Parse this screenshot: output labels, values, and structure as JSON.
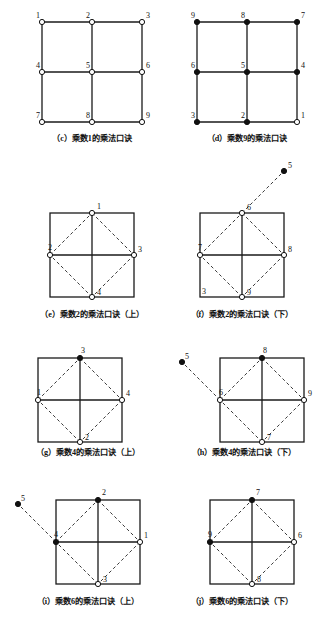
{
  "figure": {
    "panels": [
      {
        "key": "c",
        "type": "grid3x3",
        "caption": "（c）乘数1的乘法口诀",
        "nodes": [
          {
            "label": "1",
            "col": 0,
            "row": 0,
            "filled": false,
            "lx": -6,
            "ly": -4
          },
          {
            "label": "2",
            "col": 1,
            "row": 0,
            "filled": false,
            "lx": -6,
            "ly": -4
          },
          {
            "label": "3",
            "col": 2,
            "row": 0,
            "filled": false,
            "lx": 4,
            "ly": -4
          },
          {
            "label": "4",
            "col": 0,
            "row": 1,
            "filled": false,
            "lx": -6,
            "ly": -4
          },
          {
            "label": "5",
            "col": 1,
            "row": 1,
            "filled": false,
            "lx": -6,
            "ly": -4
          },
          {
            "label": "6",
            "col": 2,
            "row": 1,
            "filled": false,
            "lx": 4,
            "ly": -4
          },
          {
            "label": "7",
            "col": 0,
            "row": 2,
            "filled": false,
            "lx": -6,
            "ly": -4
          },
          {
            "label": "8",
            "col": 1,
            "row": 2,
            "filled": false,
            "lx": -6,
            "ly": -4
          },
          {
            "label": "9",
            "col": 2,
            "row": 2,
            "filled": false,
            "lx": 4,
            "ly": -4
          }
        ],
        "external": null
      },
      {
        "key": "d",
        "type": "grid3x3",
        "caption": "（d）乘数9的乘法口诀",
        "nodes": [
          {
            "label": "9",
            "col": 0,
            "row": 0,
            "filled": true,
            "lx": -6,
            "ly": -4
          },
          {
            "label": "8",
            "col": 1,
            "row": 0,
            "filled": true,
            "lx": -6,
            "ly": -4
          },
          {
            "label": "7",
            "col": 2,
            "row": 0,
            "filled": true,
            "lx": 4,
            "ly": -4
          },
          {
            "label": "6",
            "col": 0,
            "row": 1,
            "filled": true,
            "lx": -6,
            "ly": -4
          },
          {
            "label": "5",
            "col": 1,
            "row": 1,
            "filled": true,
            "lx": -6,
            "ly": -4
          },
          {
            "label": "4",
            "col": 2,
            "row": 1,
            "filled": true,
            "lx": 4,
            "ly": -4
          },
          {
            "label": "3",
            "col": 0,
            "row": 2,
            "filled": true,
            "lx": -6,
            "ly": -4
          },
          {
            "label": "2",
            "col": 1,
            "row": 2,
            "filled": true,
            "lx": -6,
            "ly": -4
          },
          {
            "label": "1",
            "col": 2,
            "row": 2,
            "filled": false,
            "lx": 4,
            "ly": -4
          }
        ],
        "external": null
      },
      {
        "key": "e",
        "type": "diamond",
        "caption": "（e）乘数2的乘法口诀（上）",
        "nodes": [
          {
            "label": "1",
            "pos": "top",
            "filled": false,
            "lx": 5,
            "ly": -4
          },
          {
            "label": "2",
            "pos": "left",
            "filled": false,
            "lx": -2,
            "ly": -5
          },
          {
            "label": "3",
            "pos": "right",
            "filled": false,
            "lx": 4,
            "ly": -3
          },
          {
            "label": "4",
            "pos": "bottom",
            "filled": false,
            "lx": 5,
            "ly": -2
          }
        ],
        "corner_label": null,
        "external": null
      },
      {
        "key": "f",
        "type": "diamond",
        "caption": "（f）乘数2的乘法口诀（下）",
        "nodes": [
          {
            "label": "6",
            "pos": "top",
            "filled": false,
            "lx": 5,
            "ly": -3
          },
          {
            "label": "7",
            "pos": "left",
            "filled": false,
            "lx": -2,
            "ly": -5
          },
          {
            "label": "8",
            "pos": "right",
            "filled": false,
            "lx": 4,
            "ly": -3
          },
          {
            "label": "9",
            "pos": "bottom",
            "filled": false,
            "lx": 5,
            "ly": -2
          }
        ],
        "corner_label": {
          "text": "3",
          "corner": "bottom-left"
        },
        "external": {
          "label": "5",
          "filled": true,
          "attach": "top",
          "dx": 42,
          "dy": -42,
          "lx": 4,
          "ly": -3
        }
      },
      {
        "key": "g",
        "type": "diamond",
        "caption": "（g）乘数4的乘法口诀（上）",
        "nodes": [
          {
            "label": "3",
            "pos": "top",
            "filled": true,
            "lx": 1,
            "ly": -5
          },
          {
            "label": "1",
            "pos": "left",
            "filled": false,
            "lx": -1,
            "ly": -5
          },
          {
            "label": "4",
            "pos": "right",
            "filled": false,
            "lx": 4,
            "ly": -4
          },
          {
            "label": "2",
            "pos": "bottom",
            "filled": false,
            "lx": 5,
            "ly": -2
          }
        ],
        "corner_label": null,
        "external": null
      },
      {
        "key": "h",
        "type": "diamond",
        "caption": "（h）乘数4的乘法口诀（下）",
        "nodes": [
          {
            "label": "8",
            "pos": "top",
            "filled": true,
            "lx": 1,
            "ly": -5
          },
          {
            "label": "6",
            "pos": "left",
            "filled": false,
            "lx": -1,
            "ly": -5
          },
          {
            "label": "9",
            "pos": "right",
            "filled": false,
            "lx": 4,
            "ly": -4
          },
          {
            "label": "7",
            "pos": "bottom",
            "filled": false,
            "lx": 5,
            "ly": -2
          }
        ],
        "corner_label": null,
        "external": {
          "label": "5",
          "filled": true,
          "attach": "left",
          "dx": -38,
          "dy": -38,
          "lx": 3,
          "ly": -3
        }
      },
      {
        "key": "i",
        "type": "diamond",
        "caption": "（i）乘数6的乘法口诀（上）",
        "nodes": [
          {
            "label": "2",
            "pos": "top",
            "filled": true,
            "lx": 4,
            "ly": -5
          },
          {
            "label": "4",
            "pos": "left",
            "filled": true,
            "lx": -2,
            "ly": -5
          },
          {
            "label": "1",
            "pos": "right",
            "filled": false,
            "lx": 4,
            "ly": -4
          },
          {
            "label": "3",
            "pos": "bottom",
            "filled": false,
            "lx": 5,
            "ly": -2
          }
        ],
        "corner_label": null,
        "external": {
          "label": "5",
          "filled": true,
          "attach": "left",
          "dx": -38,
          "dy": -38,
          "lx": 3,
          "ly": -3
        }
      },
      {
        "key": "j",
        "type": "diamond",
        "caption": "（j）乘数6的乘法口诀（下）",
        "nodes": [
          {
            "label": "7",
            "pos": "top",
            "filled": true,
            "lx": 4,
            "ly": -5
          },
          {
            "label": "9",
            "pos": "left",
            "filled": true,
            "lx": -2,
            "ly": -5
          },
          {
            "label": "6",
            "pos": "right",
            "filled": false,
            "lx": 4,
            "ly": -4
          },
          {
            "label": "8",
            "pos": "bottom",
            "filled": false,
            "lx": 5,
            "ly": -2
          }
        ],
        "corner_label": null,
        "external": null
      }
    ],
    "style": {
      "line_color": "#1a1a1a",
      "dash_color": "#3a3a3a",
      "node_stroke": "#111111",
      "node_fill_open": "#ffffff",
      "node_fill_solid": "#111111",
      "background": "#ffffff"
    },
    "layout": {
      "panel_positions": [
        {
          "key": "c",
          "x": 42,
          "y": 22,
          "w": 100,
          "h": 100,
          "cap_x": 22,
          "cap_y": 133,
          "cap_w": 140
        },
        {
          "key": "d",
          "x": 197,
          "y": 22,
          "w": 100,
          "h": 100,
          "cap_x": 177,
          "cap_y": 133,
          "cap_w": 140
        },
        {
          "key": "e",
          "x": 50,
          "y": 213,
          "w": 84,
          "h": 84,
          "cap_x": 16,
          "cap_y": 309,
          "cap_w": 152
        },
        {
          "key": "f",
          "x": 200,
          "y": 213,
          "w": 84,
          "h": 84,
          "cap_x": 166,
          "cap_y": 309,
          "cap_w": 152
        },
        {
          "key": "g",
          "x": 38,
          "y": 358,
          "w": 84,
          "h": 84,
          "cap_x": 12,
          "cap_y": 447,
          "cap_w": 152
        },
        {
          "key": "h",
          "x": 220,
          "y": 358,
          "w": 84,
          "h": 84,
          "cap_x": 168,
          "cap_y": 447,
          "cap_w": 152
        },
        {
          "key": "i",
          "x": 56,
          "y": 500,
          "w": 84,
          "h": 84,
          "cap_x": 12,
          "cap_y": 596,
          "cap_w": 152
        },
        {
          "key": "j",
          "x": 210,
          "y": 500,
          "w": 84,
          "h": 84,
          "cap_x": 166,
          "cap_y": 596,
          "cap_w": 152
        }
      ]
    }
  }
}
